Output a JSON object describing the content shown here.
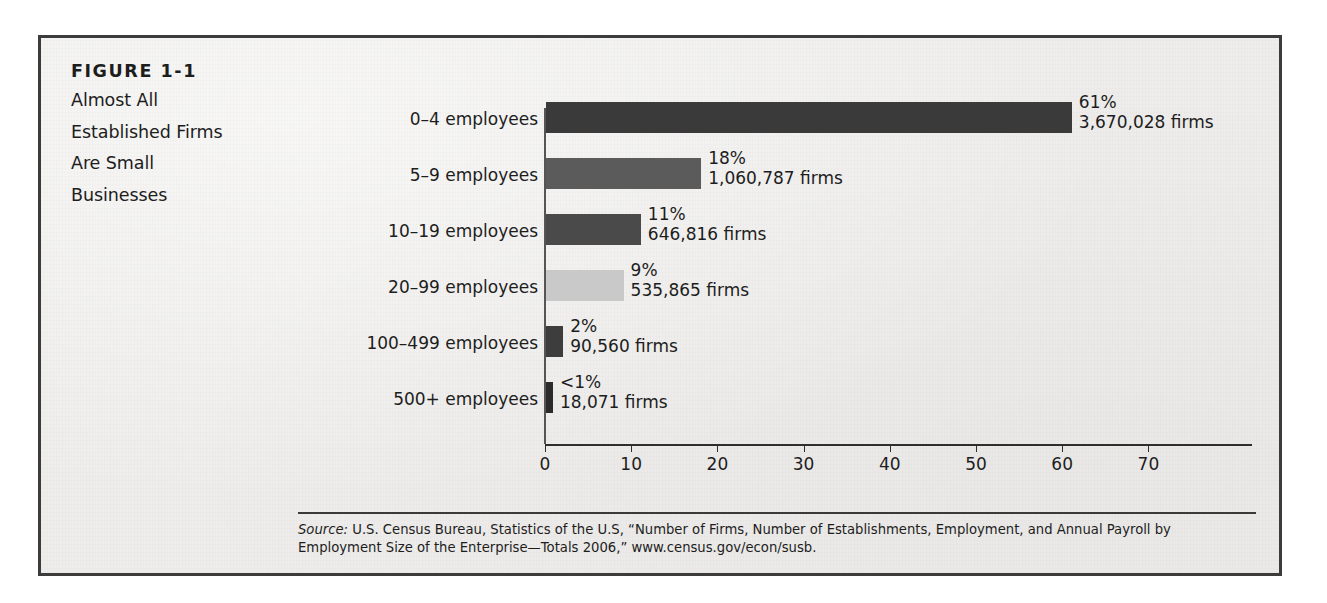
{
  "figure": {
    "number": "FIGURE 1-1",
    "title_lines": [
      "Almost All",
      "Established Firms",
      "Are Small",
      "Businesses"
    ]
  },
  "source": {
    "label": "Source:",
    "text": " U.S. Census Bureau, Statistics of the U.S, “Number of Firms, Number of Establishments, Employment, and Annual Payroll by Employment Size of the Enterprise—Totals 2006,” www.census.gov/econ/susb."
  },
  "chart_data": {
    "type": "bar",
    "orientation": "horizontal",
    "title": "Almost All Established Firms Are Small Businesses",
    "xlabel": "",
    "ylabel": "",
    "xlim": [
      0,
      82
    ],
    "grid": false,
    "legend": "none",
    "xticks": [
      0,
      10,
      20,
      30,
      40,
      50,
      60,
      70
    ],
    "xtick_labels": [
      "0",
      "10",
      "20",
      "30",
      "40",
      "50",
      "60",
      "70"
    ],
    "categories": [
      "0–4 employees",
      "5–9 employees",
      "10–19 employees",
      "20–99 employees",
      "100–499 employees",
      "500+ employees"
    ],
    "values": [
      61,
      18,
      11,
      9,
      2,
      0.8
    ],
    "value_labels": [
      "61%",
      "18%",
      "11%",
      "9%",
      "2%",
      "<1%"
    ],
    "count_labels": [
      "3,670,028 firms",
      "1,060,787 firms",
      "646,816 firms",
      "535,865 firms",
      "90,560 firms",
      "18,071 firms"
    ],
    "counts": [
      3670028,
      1060787,
      646816,
      535865,
      90560,
      18071
    ],
    "bar_colors": [
      "#3a3a3a",
      "#5b5b5b",
      "#4a4a4a",
      "#c9c9c9",
      "#3d3d3d",
      "#2b2b2b"
    ]
  },
  "colors": {
    "paper": "#eeedeb",
    "frame": "#3c3c3c",
    "ink": "#1d1d1d",
    "axis": "#2e2e2e"
  }
}
